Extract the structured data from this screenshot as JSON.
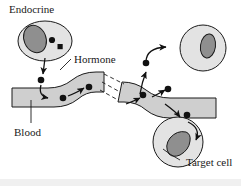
{
  "figure": {
    "name": "endocrine-hormone-target-cell-diagram",
    "background_color": "#ffffff",
    "width": 241,
    "height": 186
  },
  "labels": {
    "endocrine": "Endocrine",
    "hormone": "Hormone",
    "blood": "Blood",
    "target_cell": "Target cell"
  },
  "colors": {
    "outline": "#1a1a1a",
    "cell_fill": "#e3e3e3",
    "nucleus_fill": "#8f8f8f",
    "vessel_fill": "#cfcfcf",
    "hormone_dot": "#111111",
    "footer_band": "#f0f0f0"
  },
  "elements": {
    "endocrine_cell": {
      "shape": "oval",
      "nucleus": "oval-nucleus",
      "granules": [
        "dot",
        "square"
      ]
    },
    "blood_vessel": {
      "shape": "wavy-band",
      "break": "dashed-break-lines",
      "flow_direction": "left-to-right"
    },
    "top_right_cell": {
      "shape": "circle",
      "nucleus": "oval-nucleus"
    },
    "bottom_right_cell": {
      "shape": "circle",
      "nucleus": "wedge-nucleus"
    },
    "hormone_dots_count": 8,
    "arrows_count": 7
  }
}
